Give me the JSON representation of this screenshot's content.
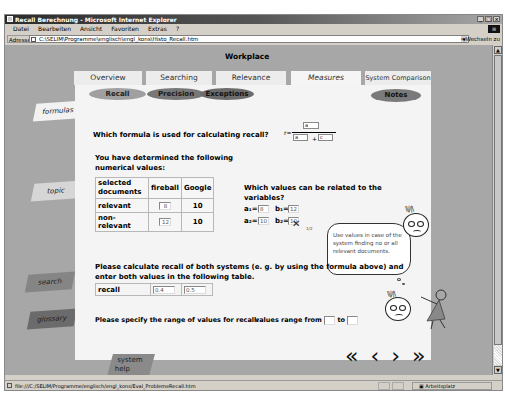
{
  "window": {
    "title": "Recall Berechnung - Microsoft Internet Explorer",
    "controls": [
      "_",
      "□",
      "×"
    ]
  },
  "menu": [
    "Datei",
    "Bearbeiten",
    "Ansicht",
    "Favoriten",
    "Extras",
    "?"
  ],
  "address": {
    "label": "Adresse",
    "url": "C:\\SELIM\\Programme\\englisch\\engl_kons\\Histo_Recall.htm",
    "go_label": "Wechseln zu"
  },
  "page": {
    "title": "Workplace",
    "tabs": [
      {
        "label": "Overview",
        "active": false
      },
      {
        "label": "Searching",
        "active": false
      },
      {
        "label": "Relevance",
        "active": false
      },
      {
        "label": "Measures",
        "active": true
      },
      {
        "label": "System Comparison",
        "active": false
      }
    ],
    "subtabs": [
      "Recall",
      "Precision",
      "Exceptions"
    ],
    "notes_button": "Notes",
    "left_nav": [
      "formulas",
      "topic",
      "search",
      "glossary"
    ],
    "system_help": [
      "system",
      "help"
    ],
    "question1": "Which formula is used for calculating recall?",
    "formula": {
      "prefix": "r=",
      "numerator": "a",
      "denominator_left": "a",
      "operator": "+",
      "denominator_right": "c"
    },
    "intro": "You have determined the following numerical values:",
    "values_table": {
      "headers": [
        "selected documents",
        "fireball",
        "Google"
      ],
      "rows": [
        {
          "label": "relevant",
          "fireball": "8",
          "google": "10"
        },
        {
          "label": "non-relevant",
          "fireball": "12",
          "google": "10"
        }
      ]
    },
    "question2": "Which values can be related to the variables?",
    "variables": {
      "a1_label": "a₁=",
      "a1_value": "8",
      "b1_label": "b₁=",
      "b1_value": "12",
      "a2_label": "a₂=",
      "a2_value": "10",
      "b2_label": "b₂=",
      "b2_value": "10"
    },
    "tooltip": {
      "pager": "1/2",
      "text": "Use values in case of the system finding no or all relevant documents."
    },
    "question3": "Please calculate recall of both systems (e. g. by using the formula above) and enter both values in the following table.",
    "recall_table": {
      "label": "recall",
      "fireball": "0.4",
      "google": "0.5"
    },
    "question4": "Please specify the range of values for recall:",
    "range": {
      "from_label": "values range from",
      "from_value": "",
      "to_label": "to",
      "to_value": ""
    },
    "nav_arrows": [
      "«",
      "‹",
      "›",
      "»"
    ]
  },
  "status": {
    "url": "file:///C:/SELIM/Programme/englisch/engl_kons/Eval_ProblemeRecall.htm",
    "zone": "Arbeitsplatz"
  }
}
